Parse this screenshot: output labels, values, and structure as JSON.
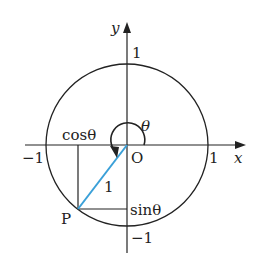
{
  "diagram": {
    "colors": {
      "ink": "#222222",
      "radius_line": "#3aa0d8",
      "background": "#ffffff"
    },
    "axes": {
      "x_label": "x",
      "y_label": "y",
      "origin_label": "O"
    },
    "ticks": {
      "x_pos": "1",
      "x_neg": "−1",
      "y_pos": "1",
      "y_neg": "−1"
    },
    "labels": {
      "angle": "θ",
      "cos": "cosθ",
      "sin": "sinθ",
      "radius": "1",
      "point": "P"
    }
  }
}
